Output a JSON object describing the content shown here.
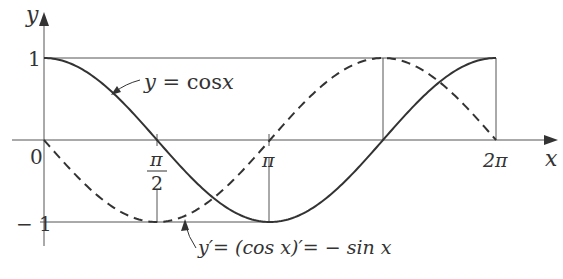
{
  "figure": {
    "axes": {
      "x_label": "x",
      "y_label": "y",
      "x_ticks": [
        {
          "value": 0,
          "label": "0"
        },
        {
          "value": 1.5708,
          "label_num": "π",
          "label_den": "2"
        },
        {
          "value": 3.1416,
          "label": "π"
        },
        {
          "value": 6.2832,
          "label": "2π"
        }
      ],
      "y_ticks": [
        {
          "value": 1,
          "label": "1"
        },
        {
          "value": -1,
          "label": "−1"
        }
      ]
    },
    "curves": [
      {
        "name": "cos",
        "style": "solid",
        "label": "y = cos x"
      },
      {
        "name": "neg-sin",
        "style": "dashed",
        "label": "y′= (cos x)′= − sin x"
      }
    ],
    "colors": {
      "line": "#333333",
      "grid": "#555555",
      "background": "#ffffff"
    }
  },
  "labels": {
    "y_axis": "y",
    "x_axis": "x",
    "origin": "0",
    "one": "1",
    "minus_one": "− 1",
    "pi_half_num": "π",
    "pi_half_den": "2",
    "pi": "π",
    "two_pi": "2π",
    "cos_label_y": "y",
    "cos_label_eq": " = cos",
    "cos_label_x": "x",
    "deriv_label": "y′= (cos x)′= − sin x"
  },
  "chart_data": {
    "type": "line",
    "title": "",
    "xlabel": "x",
    "ylabel": "y",
    "xlim": [
      0,
      6.2832
    ],
    "ylim": [
      -1,
      1
    ],
    "x_tick_labels": [
      "0",
      "π/2",
      "π",
      "2π"
    ],
    "y_tick_labels": [
      "1",
      "-1"
    ],
    "grid": false,
    "series": [
      {
        "name": "y = cos x",
        "style": "solid",
        "x": [
          0,
          0.7854,
          1.5708,
          2.3562,
          3.1416,
          3.927,
          4.7124,
          5.4978,
          6.2832
        ],
        "values": [
          1,
          0.707,
          0,
          -0.707,
          -1,
          -0.707,
          0,
          0.707,
          1
        ]
      },
      {
        "name": "y' = (cos x)' = -sin x",
        "style": "dashed",
        "x": [
          0,
          0.7854,
          1.5708,
          2.3562,
          3.1416,
          3.927,
          4.7124,
          5.4978,
          6.2832
        ],
        "values": [
          0,
          -0.707,
          -1,
          -0.707,
          0,
          0.707,
          1,
          0.707,
          0
        ]
      }
    ],
    "annotations": [
      "y = cos x",
      "y′ = (cos x)′ = − sin x"
    ]
  }
}
